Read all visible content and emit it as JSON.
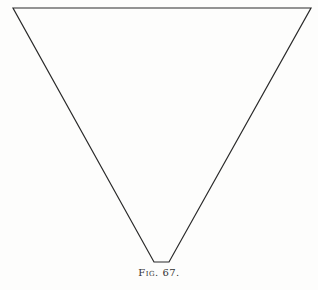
{
  "figure": {
    "caption_label": "Fig.",
    "caption_number": "67.",
    "shape": "truncated-inverted-triangle",
    "stroke_color": "#2a2a2a",
    "vertices": {
      "top_left": [
        13,
        8
      ],
      "top_right": [
        311,
        8
      ],
      "bottom_right": [
        169,
        262
      ],
      "bottom_left": [
        154,
        262
      ]
    }
  }
}
